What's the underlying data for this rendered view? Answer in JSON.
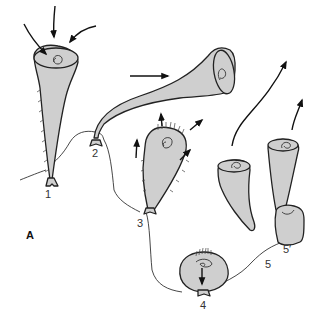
{
  "figure": {
    "panel_label": "A",
    "stage_labels": {
      "s1": "1",
      "s2": "2",
      "s3": "3",
      "s4": "4",
      "s5": "5",
      "s5p": "5′"
    },
    "fill_color": "#cfcfcf",
    "stroke_color": "#222222",
    "background": "#ffffff"
  }
}
